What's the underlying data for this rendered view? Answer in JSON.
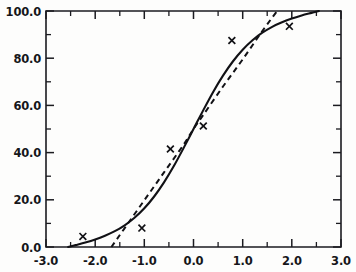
{
  "chart_data": {
    "type": "line",
    "title": "",
    "xlabel": "",
    "ylabel": "",
    "xlim": [
      -3.0,
      3.0
    ],
    "ylim": [
      0.0,
      100.0
    ],
    "grid": false,
    "legend": "none",
    "frame": "box",
    "tick_direction": "inward",
    "x_ticks_major": [
      "-3.0",
      "-2.0",
      "-1.0",
      "0.0",
      "1.0",
      "2.0",
      "3.0"
    ],
    "x_ticks_major_values": [
      -3.0,
      -2.0,
      -1.0,
      0.0,
      1.0,
      2.0,
      3.0
    ],
    "x_ticks_minor_values": [
      -2.5,
      -1.5,
      -0.5,
      0.5,
      1.5,
      2.5
    ],
    "y_ticks_major": [
      "0.0",
      "20.0",
      "40.0",
      "60.0",
      "80.0",
      "100.0"
    ],
    "y_ticks_major_values": [
      0.0,
      20.0,
      40.0,
      60.0,
      80.0,
      100.0
    ],
    "y_ticks_minor_values": [
      10.0,
      30.0,
      50.0,
      70.0,
      90.0
    ],
    "series": [
      {
        "name": "fitted-curve-solid",
        "style": "solid",
        "color": "#111115",
        "x": [
          -2.55,
          -2.4,
          -2.2,
          -2.0,
          -1.8,
          -1.6,
          -1.4,
          -1.2,
          -1.0,
          -0.8,
          -0.6,
          -0.4,
          -0.2,
          0.0,
          0.2,
          0.4,
          0.6,
          0.8,
          1.0,
          1.2,
          1.4,
          1.6,
          1.8,
          2.0,
          2.2,
          2.4,
          2.55
        ],
        "y": [
          0.0,
          0.8,
          1.9,
          3.2,
          4.8,
          6.7,
          9.2,
          12.4,
          16.4,
          21.4,
          27.4,
          34.3,
          42.0,
          50.0,
          58.0,
          65.7,
          72.6,
          78.6,
          83.6,
          87.6,
          90.8,
          93.3,
          95.2,
          96.8,
          98.1,
          99.2,
          100.0
        ]
      },
      {
        "name": "reference-line-dashed",
        "style": "dashed",
        "color": "#121216",
        "x": [
          -1.67,
          -1.4,
          -1.0,
          -0.6,
          -0.2,
          0.0,
          0.2,
          0.6,
          1.0,
          1.4,
          1.7
        ],
        "y": [
          0.0,
          8.0,
          19.8,
          31.6,
          43.4,
          50.0,
          56.0,
          68.0,
          79.5,
          91.5,
          100.0
        ]
      },
      {
        "name": "observed-data-points",
        "style": "markers",
        "marker": "x",
        "color": "#111115",
        "x": [
          -2.25,
          -1.05,
          -0.47,
          0.2,
          0.78,
          1.95
        ],
        "y": [
          4.5,
          8.0,
          41.5,
          51.3,
          87.5,
          93.5
        ]
      }
    ]
  }
}
